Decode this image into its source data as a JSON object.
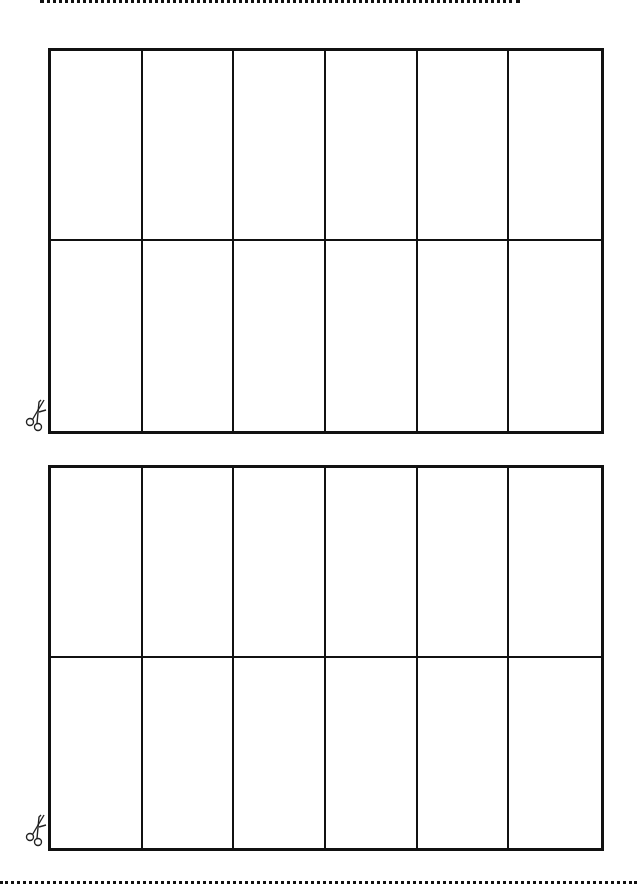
{
  "page": {
    "background": "#ffffff",
    "line_color": "#111111"
  },
  "cut_lines": [
    {
      "position": "top",
      "style": "dotted"
    },
    {
      "position": "bottom",
      "style": "dotted"
    }
  ],
  "grids": [
    {
      "id": "grid-1",
      "rows": 2,
      "columns": 6,
      "cells": [
        "",
        "",
        "",
        "",
        "",
        "",
        "",
        "",
        "",
        "",
        "",
        ""
      ],
      "icon": "scissors-icon"
    },
    {
      "id": "grid-2",
      "rows": 2,
      "columns": 6,
      "cells": [
        "",
        "",
        "",
        "",
        "",
        "",
        "",
        "",
        "",
        "",
        "",
        ""
      ],
      "icon": "scissors-icon"
    }
  ]
}
